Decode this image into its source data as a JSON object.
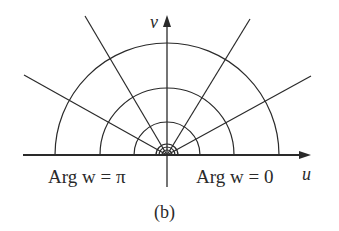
{
  "figure": {
    "caption": "(b)",
    "axes": {
      "horizontal_label": "u",
      "vertical_label": "v"
    },
    "annotations": {
      "left": "Arg w = π",
      "right": "Arg w = 0"
    },
    "circles_radii_px": [
      112,
      67,
      33,
      11,
      8,
      5
    ],
    "ray_angles_deg": [
      30,
      60,
      120,
      150
    ],
    "line_color": "#2a2a2a"
  }
}
